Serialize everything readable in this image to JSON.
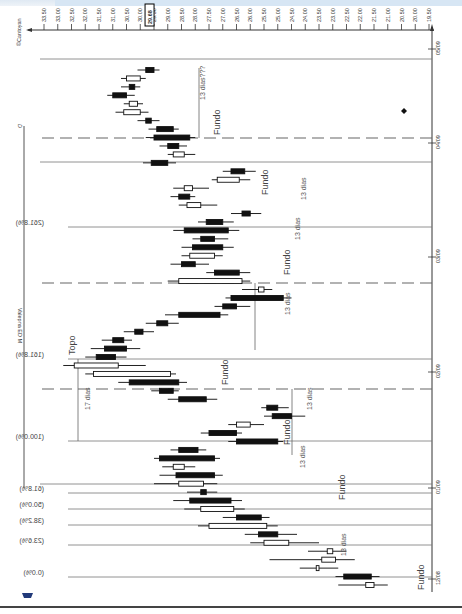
{
  "page": {
    "header_strip": "",
    "copyright": "©Cantoyan",
    "title": "Valepna ED M",
    "title_marker": "D"
  },
  "price_axis": {
    "orientation": "top, decreasing left to right",
    "ticks": [
      "33.50",
      "33.00",
      "32.50",
      "32.00",
      "31.50",
      "31.00",
      "30.50",
      "30.00",
      "29.50",
      "29.00",
      "28.50",
      "28.00",
      "27.50",
      "27.00",
      "26.50",
      "26.00",
      "25.50",
      "25.00",
      "24.50",
      "24.00",
      "23.50",
      "23.00",
      "22.50",
      "22.00",
      "21.50",
      "21.00",
      "20.50",
      "20.00",
      "19.50"
    ],
    "current_price": "29.68"
  },
  "date_axis": {
    "orientation": "right, time increasing bottom to top",
    "ticks": [
      "12/08",
      "01/09",
      "02/09",
      "03/09",
      "04/09",
      "05/09"
    ]
  },
  "fib_levels": [
    {
      "label": "(0.0%)",
      "price": 21.0
    },
    {
      "label": "(23.6%)",
      "price": 22.6
    },
    {
      "label": "(38.2%)",
      "price": 23.6
    },
    {
      "label": "(50.0%)",
      "price": 24.4
    },
    {
      "label": "(61.8%)",
      "price": 25.2
    },
    {
      "label": "(100.0%)",
      "price": 27.8
    },
    {
      "label": "(161.8%)",
      "price": 32.0
    },
    {
      "label": "(261.8%)",
      "price": 38.8
    }
  ],
  "annotations": {
    "fundo": "Fundo",
    "topo": "Topo",
    "dias13": "13 dias",
    "dias17": "17 dias",
    "dias13q": "13 dias???"
  },
  "chart_data": {
    "type": "candlestick",
    "title": "Valepna ED M",
    "xlabel": "Date",
    "ylabel": "Price",
    "ylim": [
      19.5,
      33.5
    ],
    "x_ticks": [
      "12/08",
      "01/09",
      "02/09",
      "03/09",
      "04/09",
      "05/09"
    ],
    "y_ticks": [
      33.5,
      33.0,
      32.5,
      32.0,
      31.5,
      31.0,
      30.5,
      30.0,
      29.5,
      29.0,
      28.5,
      28.0,
      27.5,
      27.0,
      26.5,
      26.0,
      25.5,
      25.0,
      24.5,
      24.0,
      23.5,
      23.0,
      22.5,
      22.0,
      21.5,
      21.0,
      20.5,
      20.0,
      19.5
    ],
    "current_price": 29.68,
    "fibonacci_levels": {
      "0.0%": 21.0,
      "23.6%": 22.6,
      "38.2%": 23.6,
      "50.0%": 24.4,
      "61.8%": 25.2,
      "100.0%": 27.8,
      "161.8%": 32.0,
      "261.8%": 38.8
    },
    "candles": [
      {
        "t": 0,
        "o": 21.5,
        "c": 21.8,
        "h": 21.0,
        "l": 22.8
      },
      {
        "t": 1,
        "o": 22.6,
        "c": 21.6,
        "h": 21.3,
        "l": 22.9
      },
      {
        "t": 2,
        "o": 23.5,
        "c": 23.6,
        "h": 22.8,
        "l": 24.2
      },
      {
        "t": 3,
        "o": 22.9,
        "c": 23.4,
        "h": 22.2,
        "l": 25.3
      },
      {
        "t": 4,
        "o": 23.0,
        "c": 23.2,
        "h": 22.5,
        "l": 23.9
      },
      {
        "t": 5,
        "o": 24.6,
        "c": 25.5,
        "h": 23.5,
        "l": 26.0
      },
      {
        "t": 6,
        "o": 25.7,
        "c": 25.0,
        "h": 24.3,
        "l": 26.2
      },
      {
        "t": 7,
        "o": 25.4,
        "c": 27.5,
        "h": 25.0,
        "l": 27.9
      },
      {
        "t": 8,
        "o": 26.5,
        "c": 25.6,
        "h": 25.3,
        "l": 27.0
      },
      {
        "t": 9,
        "o": 26.6,
        "c": 27.8,
        "h": 26.2,
        "l": 28.4
      },
      {
        "t": 10,
        "o": 28.2,
        "c": 26.7,
        "h": 26.3,
        "l": 28.8
      },
      {
        "t": 11,
        "o": 27.8,
        "c": 27.6,
        "h": 27.2,
        "l": 28.3
      },
      {
        "t": 12,
        "o": 27.7,
        "c": 28.6,
        "h": 27.2,
        "l": 29.5
      },
      {
        "t": 13,
        "o": 28.7,
        "c": 27.3,
        "h": 27.0,
        "l": 29.3
      },
      {
        "t": 14,
        "o": 28.4,
        "c": 28.8,
        "h": 28.0,
        "l": 29.2
      },
      {
        "t": 15,
        "o": 29.3,
        "c": 27.3,
        "h": 27.1,
        "l": 29.5
      },
      {
        "t": 16,
        "o": 28.6,
        "c": 27.9,
        "h": 27.6,
        "l": 28.9
      },
      {
        "t": 17,
        "o": 26.5,
        "c": 25.0,
        "h": 24.8,
        "l": 26.8
      },
      {
        "t": 18,
        "o": 27.5,
        "c": 26.5,
        "h": 26.3,
        "l": 27.8
      },
      {
        "t": 19,
        "o": 26.0,
        "c": 26.5,
        "h": 25.5,
        "l": 26.8
      },
      {
        "t": 20,
        "o": 25.2,
        "c": 24.5,
        "h": 24.0,
        "l": 25.5
      },
      {
        "t": 21,
        "o": 25.4,
        "c": 25.0,
        "h": 24.6,
        "l": 25.6
      },
      {
        "t": 22,
        "o": 28.6,
        "c": 27.6,
        "h": 27.2,
        "l": 29.0
      },
      {
        "t": 23,
        "o": 29.3,
        "c": 28.8,
        "h": 28.6,
        "l": 29.6
      },
      {
        "t": 24,
        "o": 30.4,
        "c": 28.6,
        "h": 28.3,
        "l": 30.8
      },
      {
        "t": 25,
        "o": 28.9,
        "c": 31.7,
        "h": 28.7,
        "l": 32.0
      },
      {
        "t": 26,
        "o": 30.8,
        "c": 32.4,
        "h": 29.8,
        "l": 32.8
      },
      {
        "t": 27,
        "o": 31.6,
        "c": 30.9,
        "h": 30.5,
        "l": 32.0
      },
      {
        "t": 28,
        "o": 31.3,
        "c": 30.5,
        "h": 30.0,
        "l": 31.8
      },
      {
        "t": 29,
        "o": 31.0,
        "c": 30.6,
        "h": 30.3,
        "l": 31.4
      },
      {
        "t": 30,
        "o": 30.2,
        "c": 29.9,
        "h": 29.5,
        "l": 30.6
      },
      {
        "t": 31,
        "o": 29.4,
        "c": 29.0,
        "h": 28.6,
        "l": 29.8
      },
      {
        "t": 32,
        "o": 28.6,
        "c": 27.1,
        "h": 26.8,
        "l": 29.1
      },
      {
        "t": 33,
        "o": 27.0,
        "c": 26.5,
        "h": 26.0,
        "l": 27.3
      },
      {
        "t": 34,
        "o": 26.7,
        "c": 24.8,
        "h": 24.5,
        "l": 26.9
      },
      {
        "t": 35,
        "o": 25.5,
        "c": 25.7,
        "h": 25.2,
        "l": 26.3
      },
      {
        "t": 36,
        "o": 26.3,
        "c": 28.6,
        "h": 26.0,
        "l": 29.0
      },
      {
        "t": 37,
        "o": 27.3,
        "c": 26.4,
        "h": 26.0,
        "l": 27.6
      },
      {
        "t": 38,
        "o": 28.5,
        "c": 28.0,
        "h": 27.5,
        "l": 28.9
      },
      {
        "t": 39,
        "o": 27.3,
        "c": 28.2,
        "h": 27.0,
        "l": 28.5
      },
      {
        "t": 40,
        "o": 28.1,
        "c": 27.0,
        "h": 26.6,
        "l": 28.5
      },
      {
        "t": 41,
        "o": 27.8,
        "c": 27.3,
        "h": 26.8,
        "l": 28.1
      },
      {
        "t": 42,
        "o": 28.4,
        "c": 26.8,
        "h": 26.4,
        "l": 28.8
      },
      {
        "t": 43,
        "o": 27.6,
        "c": 27.0,
        "h": 26.6,
        "l": 27.9
      },
      {
        "t": 44,
        "o": 26.3,
        "c": 26.0,
        "h": 25.6,
        "l": 26.7
      },
      {
        "t": 45,
        "o": 27.8,
        "c": 28.3,
        "h": 27.2,
        "l": 28.6
      },
      {
        "t": 46,
        "o": 28.6,
        "c": 28.2,
        "h": 28.0,
        "l": 28.9
      },
      {
        "t": 47,
        "o": 28.1,
        "c": 28.4,
        "h": 27.5,
        "l": 28.8
      },
      {
        "t": 48,
        "o": 26.4,
        "c": 27.2,
        "h": 26.0,
        "l": 27.4
      },
      {
        "t": 49,
        "o": 26.7,
        "c": 26.2,
        "h": 25.8,
        "l": 27.0
      },
      {
        "t": 50,
        "o": 29.6,
        "c": 29.0,
        "h": 28.7,
        "l": 29.9
      },
      {
        "t": 51,
        "o": 28.4,
        "c": 28.8,
        "h": 28.0,
        "l": 29.0
      },
      {
        "t": 52,
        "o": 29.0,
        "c": 28.6,
        "h": 28.3,
        "l": 29.3
      },
      {
        "t": 53,
        "o": 29.5,
        "c": 28.2,
        "h": 28.0,
        "l": 29.8
      },
      {
        "t": 54,
        "o": 29.4,
        "c": 28.8,
        "h": 28.6,
        "l": 29.7
      },
      {
        "t": 55,
        "o": 29.8,
        "c": 29.6,
        "h": 29.3,
        "l": 30.1
      },
      {
        "t": 56,
        "o": 30.0,
        "c": 30.6,
        "h": 29.7,
        "l": 30.9
      },
      {
        "t": 57,
        "o": 30.1,
        "c": 30.4,
        "h": 29.9,
        "l": 30.6
      },
      {
        "t": 58,
        "o": 31.0,
        "c": 30.5,
        "h": 30.2,
        "l": 31.2
      },
      {
        "t": 59,
        "o": 30.4,
        "c": 30.2,
        "h": 30.0,
        "l": 30.7
      },
      {
        "t": 60,
        "o": 30.0,
        "c": 30.5,
        "h": 29.8,
        "l": 30.7
      },
      {
        "t": 61,
        "o": 29.8,
        "c": 29.5,
        "h": 29.3,
        "l": 30.1
      }
    ]
  }
}
